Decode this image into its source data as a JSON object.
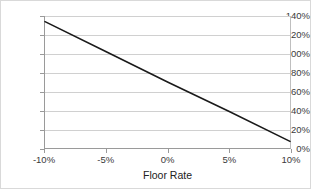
{
  "chart_data": {
    "type": "line",
    "title": "",
    "subtitle": "",
    "xlabel": "Floor Rate",
    "ylabel": "",
    "xlim": [
      -10,
      10
    ],
    "ylim": [
      0,
      140
    ],
    "grid": true,
    "legend": false,
    "legend_position": "none",
    "line_color": "#1a1a1a",
    "grid_color": "#d0d0d0",
    "axis_color": "#9a9a9a",
    "x_tick_labels": [
      "-10%",
      "-5%",
      "0%",
      "5%",
      "10%"
    ],
    "x_tick_values": [
      -10,
      -5,
      0,
      5,
      10
    ],
    "y_tick_labels": [
      "0%",
      "20%",
      "40%",
      "60%",
      "80%",
      "100%",
      "120%",
      "140%"
    ],
    "y_tick_values": [
      0,
      20,
      40,
      60,
      80,
      100,
      120,
      140
    ],
    "series": [
      {
        "name": "",
        "x": [
          -10,
          -5,
          0,
          5,
          10
        ],
        "values": [
          134,
          102,
          70,
          39,
          7
        ]
      }
    ]
  }
}
